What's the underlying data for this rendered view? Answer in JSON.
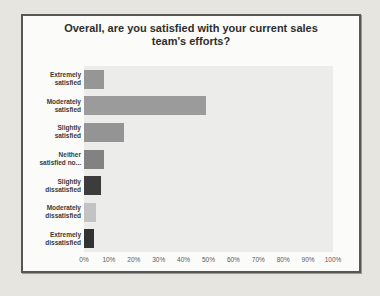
{
  "page": {
    "background_color": "#e7e5e0",
    "card_background_color": "#fbfbf9",
    "card_border_color": "#575757"
  },
  "chart_data": {
    "type": "bar",
    "orientation": "horizontal",
    "title": "Overall, are you satisfied with your current sales team's efforts?",
    "categories": [
      "Extremely satisfied",
      "Moderately satisfied",
      "Slightly satisfied",
      "Neither satisfied no...",
      "Slightly dissatisfied",
      "Moderately dissatisfied",
      "Extremely dissatisfied"
    ],
    "category_label_lines": [
      [
        "Extremely",
        "satisfied"
      ],
      [
        "Moderately",
        "satisfied"
      ],
      [
        "Slightly",
        "satisfied"
      ],
      [
        "Neither",
        "satisfied no..."
      ],
      [
        "Slightly",
        "dissatisfied"
      ],
      [
        "Moderately",
        "dissatisfied"
      ],
      [
        "Extremely",
        "dissatisfied"
      ]
    ],
    "values": [
      8,
      49,
      16,
      8,
      7,
      5,
      4
    ],
    "unit": "%",
    "bar_colors": [
      "#969696",
      "#9b9b9b",
      "#949494",
      "#828282",
      "#3c3c3c",
      "#c3c3c3",
      "#323232"
    ],
    "xlabel": "",
    "ylabel": "",
    "xlim": [
      0,
      100
    ],
    "x_ticks": [
      "0%",
      "10%",
      "20%",
      "30%",
      "40%",
      "50%",
      "60%",
      "70%",
      "80%",
      "90%",
      "100%"
    ],
    "grid": false,
    "legend": false,
    "plot_background_color": "#ececea"
  }
}
